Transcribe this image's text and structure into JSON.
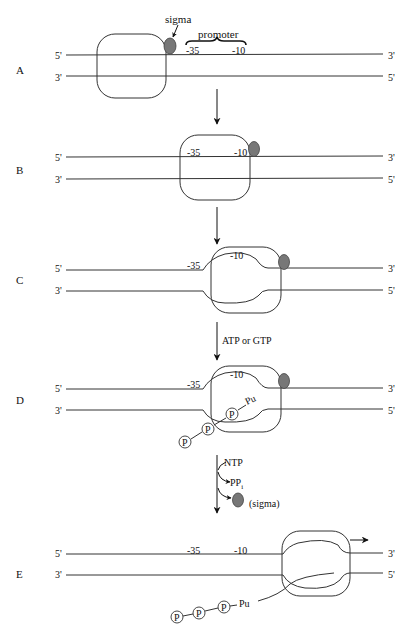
{
  "colors": {
    "line": "#333333",
    "sigma_fill": "#777777",
    "background": "#ffffff"
  },
  "strand_ends": {
    "top_left": "5'",
    "top_right": "3'",
    "bottom_left": "3'",
    "bottom_right": "5'"
  },
  "panels": [
    {
      "id": "A",
      "label": "A",
      "minus35": "-35",
      "minus10": "-10",
      "sigma_label": "sigma",
      "promoter_label": "promoter"
    },
    {
      "id": "B",
      "label": "B",
      "minus35": "-35",
      "minus10": "-10"
    },
    {
      "id": "C",
      "label": "C",
      "minus35": "-35",
      "minus10": "-10"
    },
    {
      "id": "D",
      "label": "D",
      "minus35": "-35",
      "minus10": "-10",
      "chain": [
        "P",
        "P",
        "P"
      ],
      "purine": "Pu"
    },
    {
      "id": "E",
      "label": "E",
      "minus35": "-35",
      "minus10": "-10",
      "chain": [
        "P",
        "P",
        "P"
      ],
      "purine": "Pu"
    }
  ],
  "transitions": [
    {
      "from": "A",
      "to": "B",
      "label": ""
    },
    {
      "from": "B",
      "to": "C",
      "label": ""
    },
    {
      "from": "C",
      "to": "D",
      "label": "ATP or GTP"
    },
    {
      "from": "D",
      "to": "E",
      "label_in": "NTP",
      "label_out1": "PP",
      "label_out1_sub": "i",
      "label_out2": "(sigma)"
    }
  ]
}
